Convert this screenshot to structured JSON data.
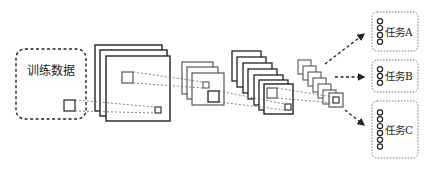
{
  "diagram": {
    "title": "",
    "input": {
      "label": "训练数据"
    },
    "layers": [
      {
        "name": "conv-layer-1",
        "maps": 3
      },
      {
        "name": "conv-layer-2",
        "maps": 3
      },
      {
        "name": "conv-layer-3",
        "maps": 6
      },
      {
        "name": "conv-layer-4",
        "maps": 6
      }
    ],
    "tasks": [
      {
        "label": "任务A",
        "nodes": 4
      },
      {
        "label": "任务B",
        "nodes": 3
      },
      {
        "label": "任务C",
        "nodes": 6
      }
    ],
    "colors": {
      "stroke": "#222222",
      "light_stroke": "#555555",
      "dashed": "#666666"
    }
  }
}
